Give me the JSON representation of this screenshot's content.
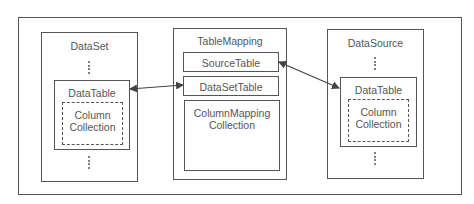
{
  "diagram": {
    "dataset": {
      "title": "DataSet",
      "datatable": {
        "title": "DataTable",
        "column_collection": "Column\nCollection",
        "column_line1": "Column",
        "column_line2": "Collection"
      }
    },
    "tablemapping": {
      "title": "TableMapping",
      "source_table": "SourceTable",
      "dataset_table": "DataSetTable",
      "column_mapping_line1": "ColumnMapping",
      "column_mapping_line2": "Collection"
    },
    "datasource": {
      "title": "DataSource",
      "datatable": {
        "title": "DataTable",
        "column_line1": "Column",
        "column_line2": "Collection"
      }
    },
    "connections": [
      {
        "from": "dataset.datatable",
        "to": "tablemapping.dataset_table",
        "type": "bidirectional"
      },
      {
        "from": "tablemapping.source_table",
        "to": "datasource.datatable",
        "type": "bidirectional"
      }
    ],
    "colors": {
      "line": "#555555",
      "background": "#ffffff"
    }
  }
}
